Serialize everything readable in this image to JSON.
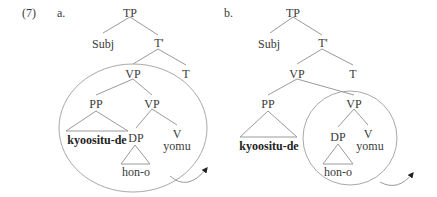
{
  "example": {
    "number": "(7)",
    "trees": [
      {
        "label": "a.",
        "nodes": {
          "tp": "TP",
          "subj": "Subj",
          "tbar": "T'",
          "vp_top": "VP",
          "t": "T",
          "pp": "PP",
          "vp_low": "VP",
          "pp_leaf": "kyoositu-de",
          "dp": "DP",
          "v": "V",
          "v_leaf": "yomu",
          "dp_leaf": "hon-o"
        },
        "circled_constituent": "VP (upper)"
      },
      {
        "label": "b.",
        "nodes": {
          "tp": "TP",
          "subj": "Subj",
          "tbar": "T'",
          "vp_top": "VP",
          "t": "T",
          "pp": "PP",
          "vp_low": "VP",
          "pp_leaf": "kyoositu-de",
          "dp": "DP",
          "v": "V",
          "v_leaf": "yomu",
          "dp_leaf": "hon-o"
        },
        "circled_constituent": "VP (lower)"
      }
    ]
  }
}
